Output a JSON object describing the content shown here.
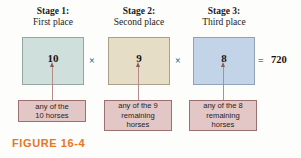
{
  "figure": {
    "caption": "FIGURE 16-4",
    "caption_color": "#e8761f",
    "background": "#fdfdfb"
  },
  "equation": {
    "multiply_symbol_1": "×",
    "multiply_symbol_2": "×",
    "equals_symbol": "=",
    "result": "720"
  },
  "stages": [
    {
      "title": "Stage 1:",
      "subtitle": "First place",
      "count": "10",
      "box_color": "#cfdfdb",
      "box_border": "#93a6a2",
      "description_lines": [
        "any of the",
        "10 horses"
      ]
    },
    {
      "title": "Stage 2:",
      "subtitle": "Second place",
      "count": "9",
      "box_color": "#e6ddc6",
      "box_border": "#a9a087",
      "description_lines": [
        "any of the 9",
        "remaining",
        "horses"
      ]
    },
    {
      "title": "Stage 3:",
      "subtitle": "Third place",
      "count": "8",
      "box_color": "#c4d4e8",
      "box_border": "#8fa2bb",
      "description_lines": [
        "any of the 8",
        "remaining",
        "horses"
      ]
    }
  ]
}
